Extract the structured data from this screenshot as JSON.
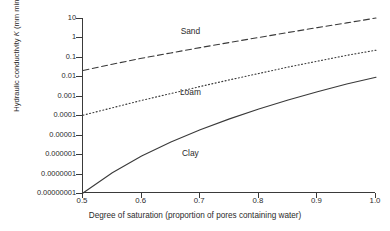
{
  "chart_data": {
    "type": "line",
    "title": "",
    "xlabel": "Degree of saturation (proportion of pores containing water)",
    "ylabel": "Hydraulic conductivity K (mm min⁻¹)",
    "ylabel_parts": {
      "prefix": "Hydraulic conductivity ",
      "symbol": "K",
      "units_open": " (mm min",
      "units_exp": "−1",
      "units_close": ")"
    },
    "xlim": [
      0.5,
      1.0
    ],
    "ylim": [
      1e-08,
      10
    ],
    "yscale": "log",
    "xscale": "linear",
    "grid": false,
    "legend_position": "inline-labels",
    "xticks": [
      0.5,
      0.6,
      0.7,
      0.8,
      0.9,
      1.0
    ],
    "xticklabels": [
      "0.5",
      "0.6",
      "0.7",
      "0.8",
      "0.9",
      "1.0"
    ],
    "yticks": [
      10,
      1,
      0.1,
      0.01,
      0.001,
      0.0001,
      1e-05,
      1e-06,
      1e-07,
      1e-08
    ],
    "yticklabels": [
      "10",
      "1",
      "0.1",
      "0.01",
      "0.001",
      "0.0001",
      "0.00001",
      "0.000001",
      "0.0000001",
      "0.00000001"
    ],
    "series": [
      {
        "name": "Sand",
        "linestyle": "dashed",
        "color": "#3a3a3a",
        "label_x": 0.685,
        "label_y": 2.2,
        "x": [
          0.5,
          0.55,
          0.6,
          0.65,
          0.7,
          0.75,
          0.8,
          0.85,
          0.9,
          0.95,
          1.0
        ],
        "y": [
          0.02,
          0.042,
          0.085,
          0.16,
          0.3,
          0.55,
          1.0,
          1.8,
          3.2,
          5.6,
          10.0
        ]
      },
      {
        "name": "Loam",
        "linestyle": "dotted",
        "color": "#3a3a3a",
        "label_x": 0.685,
        "label_y": 0.0016,
        "x": [
          0.5,
          0.55,
          0.6,
          0.65,
          0.7,
          0.75,
          0.8,
          0.85,
          0.9,
          0.95,
          1.0
        ],
        "y": [
          0.0001,
          0.00024,
          0.00058,
          0.0013,
          0.003,
          0.0066,
          0.014,
          0.03,
          0.06,
          0.12,
          0.22
        ]
      },
      {
        "name": "Clay",
        "linestyle": "solid",
        "color": "#3a3a3a",
        "label_x": 0.685,
        "label_y": 1.2e-06,
        "x": [
          0.5,
          0.55,
          0.6,
          0.65,
          0.7,
          0.75,
          0.8,
          0.85,
          0.9,
          0.95,
          1.0
        ],
        "y": [
          1e-08,
          1.1e-07,
          8e-07,
          4.2e-06,
          1.8e-05,
          6.5e-05,
          0.00021,
          0.0006,
          0.0016,
          0.004,
          0.009
        ]
      }
    ]
  }
}
